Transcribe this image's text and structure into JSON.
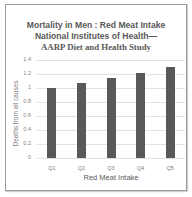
{
  "chart_data": {
    "type": "bar",
    "title": "Mortality in Men : Red Meat Intake",
    "subtitle_line1": "National Institutes of Health—",
    "subtitle_line2": "AARP Diet and Health Study",
    "categories": [
      "Q1",
      "Q2",
      "Q3",
      "Q4",
      "Q5"
    ],
    "values": [
      1.0,
      1.07,
      1.15,
      1.21,
      1.3
    ],
    "xlabel": "Red Meat Intake",
    "ylabel": "Deaths from all causes",
    "ylim": [
      0,
      1.4
    ],
    "yticks": [
      "0",
      "0.2",
      "0.4",
      "0.6",
      "0.8",
      "1",
      "1.2",
      "1.4"
    ],
    "grid": true,
    "legend": "none",
    "bar_color": "#595959"
  }
}
